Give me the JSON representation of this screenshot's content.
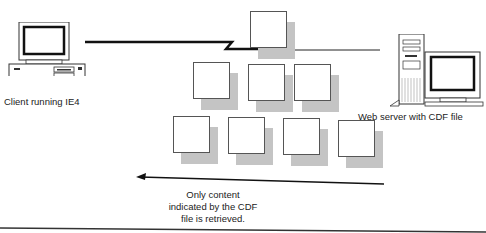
{
  "client": {
    "label": "Client running IE4"
  },
  "server": {
    "label": "Web server with CDF file"
  },
  "caption": {
    "line1": "Only content",
    "line2": "indicated by the CDF",
    "line3": "file is retrieved."
  },
  "boxes": {
    "top": [
      [
        250,
        11
      ]
    ],
    "row2": [
      [
        193,
        62
      ],
      [
        248,
        64
      ],
      [
        294,
        64
      ]
    ],
    "row3": [
      [
        173,
        116
      ],
      [
        228,
        117
      ],
      [
        283,
        118
      ],
      [
        338,
        120
      ]
    ]
  },
  "colors": {
    "line": "#111111",
    "shadow": "#c4c4c4",
    "border": "#555555"
  }
}
